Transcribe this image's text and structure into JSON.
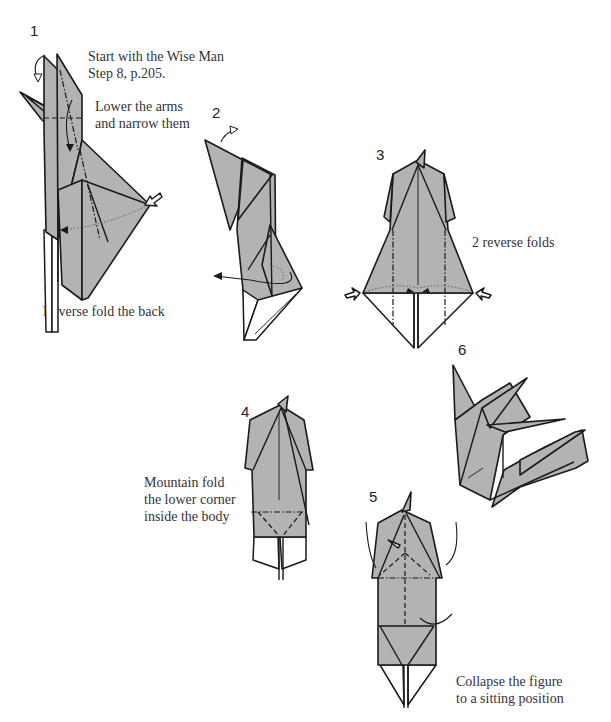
{
  "diagram": {
    "fill_color": "#b3b3b3",
    "line_color": "#1a1a1a",
    "steps": [
      {
        "number": "1",
        "captions": [
          "Start with the Wise Man\nStep 8, p.205.",
          "Lower the arms\nand narrow them",
          "Reverse fold the back"
        ]
      },
      {
        "number": "2",
        "captions": []
      },
      {
        "number": "3",
        "captions": [
          "2 reverse folds"
        ]
      },
      {
        "number": "4",
        "captions": [
          "Mountain fold\nthe lower corner\ninside the body"
        ]
      },
      {
        "number": "5",
        "captions": [
          "Collapse the figure\nto a sitting position"
        ]
      },
      {
        "number": "6",
        "captions": []
      }
    ]
  }
}
